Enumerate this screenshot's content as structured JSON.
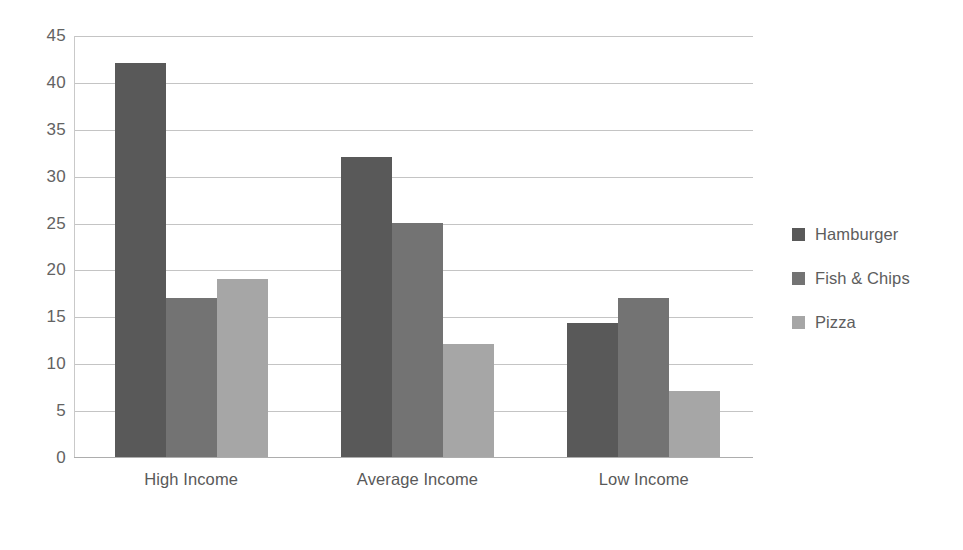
{
  "chart_data": {
    "type": "bar",
    "title": "",
    "xlabel": "",
    "ylabel": "",
    "ylim": [
      0,
      45
    ],
    "y_ticks": [
      0,
      5,
      10,
      15,
      20,
      25,
      30,
      35,
      40,
      45
    ],
    "grid": true,
    "legend_position": "right",
    "categories": [
      "High Income",
      "Average Income",
      "Low Income"
    ],
    "series": [
      {
        "name": "Hamburger",
        "color": "#595959",
        "values": [
          42,
          32,
          14.3
        ]
      },
      {
        "name": "Fish & Chips",
        "color": "#737373",
        "values": [
          17,
          25,
          17
        ]
      },
      {
        "name": "Pizza",
        "color": "#a6a6a6",
        "values": [
          19,
          12,
          7
        ]
      }
    ]
  },
  "axis": {
    "y_tick_labels": [
      "45",
      "40",
      "35",
      "30",
      "25",
      "20",
      "15",
      "10",
      "5",
      "0"
    ],
    "x_tick_labels": [
      "High Income",
      "Average Income",
      "Low Income"
    ]
  },
  "legend": {
    "entries": [
      {
        "label": "Hamburger",
        "swatch": "#595959"
      },
      {
        "label": "Fish & Chips",
        "swatch": "#737373"
      },
      {
        "label": "Pizza",
        "swatch": "#a6a6a6"
      }
    ]
  },
  "colors": {
    "background": "#ffffff",
    "gridline": "#c4c4c4",
    "axis": "#adadad",
    "tick_text": "#636363",
    "label_text": "#595959"
  }
}
